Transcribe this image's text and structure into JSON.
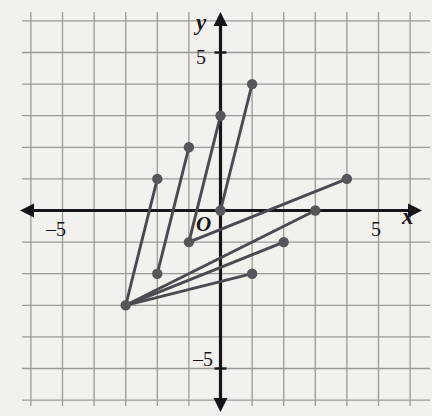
{
  "figure": {
    "type": "coordinate-plane",
    "axis_labels": {
      "x": "x",
      "y": "y",
      "origin": "O"
    },
    "tick_labels": {
      "x_positive": "5",
      "x_negative": "–5",
      "y_positive": "5",
      "y_negative": "–5"
    },
    "colors": {
      "background": "#f3f1ed",
      "grid": "#9a9a96",
      "axis": "#16161a",
      "point": "#55555a",
      "segment": "#4a4a50"
    }
  },
  "chart_data": {
    "type": "scatter",
    "title": "",
    "xlabel": "x",
    "ylabel": "y",
    "xlim": [
      -6.8,
      6.7
    ],
    "ylim": [
      -6.4,
      6.4
    ],
    "grid": true,
    "legend": "none",
    "tick_step": 1,
    "labeled_ticks": {
      "x": [
        -5,
        5
      ],
      "y": [
        -5,
        5
      ]
    },
    "points": [
      {
        "x": -2,
        "y": 1
      },
      {
        "x": -1,
        "y": 2
      },
      {
        "x": 0,
        "y": 3
      },
      {
        "x": 1,
        "y": 4
      },
      {
        "x": -3,
        "y": -3
      },
      {
        "x": -2,
        "y": -2
      },
      {
        "x": -1,
        "y": -1
      },
      {
        "x": 0,
        "y": 0
      },
      {
        "x": 1,
        "y": -2
      },
      {
        "x": 2,
        "y": -1
      },
      {
        "x": 3,
        "y": 0
      },
      {
        "x": 4,
        "y": 1
      }
    ],
    "segments": [
      {
        "name": "segment-a",
        "x1": -2,
        "y1": 1,
        "x2": -3,
        "y2": -3
      },
      {
        "name": "segment-b",
        "x1": -1,
        "y1": 2,
        "x2": -2,
        "y2": -2
      },
      {
        "name": "segment-c",
        "x1": 0,
        "y1": 3,
        "x2": -1,
        "y2": -1
      },
      {
        "name": "segment-d",
        "x1": 1,
        "y1": 4,
        "x2": 0,
        "y2": 0
      },
      {
        "name": "segment-e",
        "x1": 4,
        "y1": 1,
        "x2": -1,
        "y2": -1
      },
      {
        "name": "segment-f",
        "x1": 3,
        "y1": 0,
        "x2": -3,
        "y2": -3
      },
      {
        "name": "segment-g",
        "x1": 2,
        "y1": -1,
        "x2": -3,
        "y2": -3
      },
      {
        "name": "segment-h",
        "x1": 1,
        "y1": -2,
        "x2": -3,
        "y2": -3
      }
    ]
  }
}
